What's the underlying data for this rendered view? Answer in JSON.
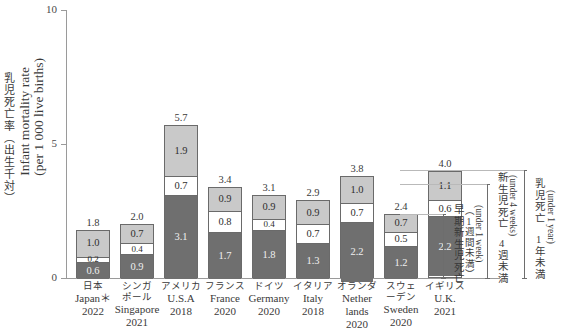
{
  "axis": {
    "y_title_jp": "乳児死亡率（出生千対）",
    "y_title_en_line1": "Infant mortality rate",
    "y_title_en_line2": "(per 1 000 live births)",
    "y_ticks": [
      "0",
      "5",
      "10"
    ]
  },
  "annotations": {
    "early_neonatal": {
      "jp": "早期新生児死亡",
      "jp_sub": "（1週間未満）",
      "en": "(under 1 week)"
    },
    "neonatal": {
      "jp": "新生児死亡",
      "jp_sub": "4週未満",
      "en": "(under 4 weeks)"
    },
    "infant": {
      "jp": "乳児死亡",
      "jp_sub": "1年未満",
      "en": "(under 1 year)"
    }
  },
  "colors": {
    "segment_top": "#c9c9c9",
    "segment_middle": "#ffffff",
    "segment_bottom": "#6f6f6f",
    "axis": "#9a9a9a",
    "text": "#3a3a3a"
  },
  "chart_data": {
    "type": "bar",
    "title": "",
    "xlabel": "",
    "ylabel": "Infant mortality rate (per 1 000 live births)",
    "ylim": [
      0,
      10
    ],
    "grid": false,
    "stacked": true,
    "legend_position": "right-brackets",
    "categories": [
      "Japan",
      "Singapore",
      "U.S.A",
      "France",
      "Germany",
      "Italy",
      "Netherlands",
      "Sweden",
      "U.K."
    ],
    "series": [
      {
        "name": "early neonatal (under 1 week)",
        "values": [
          0.6,
          0.9,
          3.1,
          1.7,
          1.8,
          1.3,
          2.2,
          1.2,
          2.2
        ]
      },
      {
        "name": "neonatal remainder (1-4 weeks)",
        "values": [
          0.2,
          0.4,
          0.7,
          0.8,
          0.4,
          0.7,
          0.7,
          0.5,
          0.6
        ]
      },
      {
        "name": "post-neonatal (4 weeks - 1 year)",
        "values": [
          1.0,
          0.7,
          1.9,
          0.9,
          0.9,
          0.9,
          1.0,
          0.7,
          1.1
        ]
      }
    ],
    "totals": [
      1.8,
      2.0,
      5.7,
      3.4,
      3.1,
      2.9,
      3.8,
      2.4,
      4.0
    ]
  },
  "bars": [
    {
      "jp": "日本",
      "en": "Japan＊",
      "year": "2022",
      "total": "1.8",
      "top": "1.0",
      "mid": "0.2",
      "bot": "0.6",
      "t_top": 1.0,
      "t_mid": 0.2,
      "t_bot": 0.6,
      "t_total": 1.8
    },
    {
      "jp": "シンガ\nポール",
      "en": "Singapore",
      "year": "2021",
      "total": "2.0",
      "top": "0.7",
      "mid": "0.4",
      "bot": "0.9",
      "t_top": 0.7,
      "t_mid": 0.4,
      "t_bot": 0.9,
      "t_total": 2.0
    },
    {
      "jp": "アメリカ",
      "en": "U.S.A",
      "year": "2018",
      "total": "5.7",
      "top": "1.9",
      "mid": "0.7",
      "bot": "3.1",
      "t_top": 1.9,
      "t_mid": 0.7,
      "t_bot": 3.1,
      "t_total": 5.7
    },
    {
      "jp": "フランス",
      "en": "France",
      "year": "2020",
      "total": "3.4",
      "top": "0.9",
      "mid": "0.8",
      "bot": "1.7",
      "t_top": 0.9,
      "t_mid": 0.8,
      "t_bot": 1.7,
      "t_total": 3.4
    },
    {
      "jp": "ドイツ",
      "en": "Germany",
      "year": "2020",
      "total": "3.1",
      "top": "0.9",
      "mid": "0.4",
      "bot": "1.8",
      "t_top": 0.9,
      "t_mid": 0.4,
      "t_bot": 1.8,
      "t_total": 3.1
    },
    {
      "jp": "イタリア",
      "en": "Italy",
      "year": "2018",
      "total": "2.9",
      "top": "0.9",
      "mid": "0.7",
      "bot": "1.3",
      "t_top": 0.9,
      "t_mid": 0.7,
      "t_bot": 1.3,
      "t_total": 2.9
    },
    {
      "jp": "オランダ",
      "en": "Nether\nlands",
      "year": "2020",
      "total": "3.8",
      "top": "1.0",
      "mid": "0.7",
      "bot": "2.2",
      "t_top": 1.0,
      "t_mid": 0.7,
      "t_bot": 2.2,
      "t_total": 3.8
    },
    {
      "jp": "スウェ\nーデン",
      "en": "Sweden",
      "year": "2020",
      "total": "2.4",
      "top": "0.7",
      "mid": "0.5",
      "bot": "1.2",
      "t_top": 0.7,
      "t_mid": 0.5,
      "t_bot": 1.2,
      "t_total": 2.4
    },
    {
      "jp": "イギリス",
      "en": "U.K.",
      "year": "2021",
      "total": "4.0",
      "top": "1.1",
      "mid": "0.6",
      "bot": "2.2",
      "t_top": 1.1,
      "t_mid": 0.6,
      "t_bot": 2.2,
      "t_total": 4.0
    }
  ]
}
